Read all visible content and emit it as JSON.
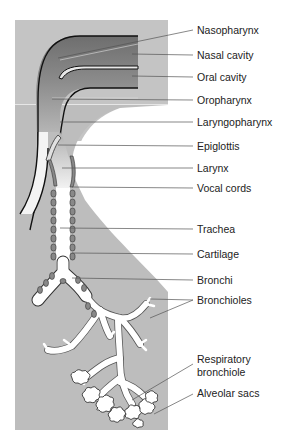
{
  "figure": {
    "colors": {
      "background": "#ffffff",
      "panel": "#bdbdbd",
      "airway_dark": "#7a7a7a",
      "airway_mid": "#9a9a9a",
      "cartilage": "#888888",
      "outline": "#111111",
      "label_text": "#222222",
      "leader_line": "#555555"
    },
    "labels": [
      {
        "id": "nasopharynx",
        "text": "Nasopharynx"
      },
      {
        "id": "nasal-cavity",
        "text": "Nasal cavity"
      },
      {
        "id": "oral-cavity",
        "text": "Oral cavity"
      },
      {
        "id": "oropharynx",
        "text": "Oropharynx"
      },
      {
        "id": "laryngopharynx",
        "text": "Laryngopharynx"
      },
      {
        "id": "epiglottis",
        "text": "Epiglottis"
      },
      {
        "id": "larynx",
        "text": "Larynx"
      },
      {
        "id": "vocal-cords",
        "text": "Vocal cords"
      },
      {
        "id": "trachea",
        "text": "Trachea"
      },
      {
        "id": "cartilage",
        "text": "Cartilage"
      },
      {
        "id": "bronchi",
        "text": "Bronchi"
      },
      {
        "id": "bronchioles",
        "text": "Bronchioles"
      },
      {
        "id": "respiratory-bronchiole-line1",
        "text": "Respiratory"
      },
      {
        "id": "respiratory-bronchiole-line2",
        "text": "bronchiole"
      },
      {
        "id": "alveolar-sacs",
        "text": "Alveolar sacs"
      }
    ]
  }
}
